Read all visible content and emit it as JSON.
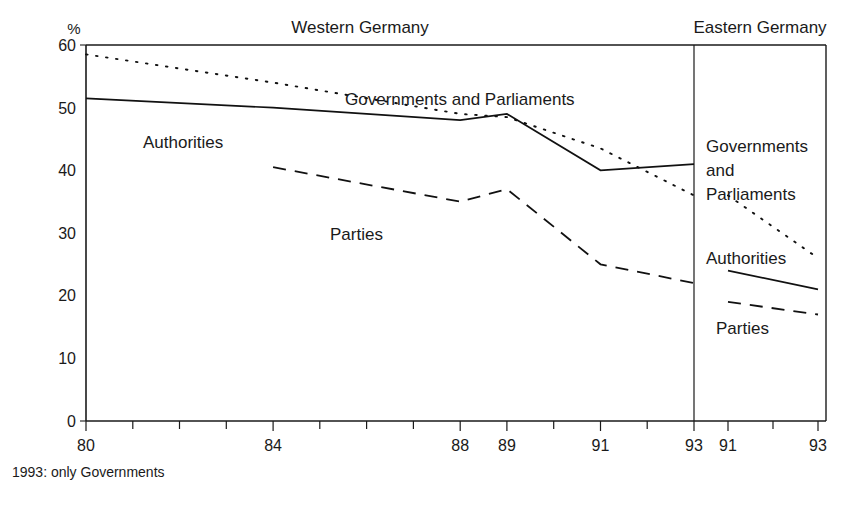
{
  "chart_data": {
    "type": "line",
    "title": "",
    "subtitle": "",
    "xlabel": "",
    "ylabel": "%",
    "ylim": [
      0,
      60
    ],
    "ytick_values": [
      0,
      10,
      20,
      30,
      40,
      50,
      60
    ],
    "ytick_labels": [
      "0",
      "10",
      "20",
      "30",
      "40",
      "50",
      "60"
    ],
    "grid": false,
    "legend_position": "inline-annotations",
    "panels": [
      {
        "name": "western",
        "title": "Western Germany",
        "x_range": [
          80,
          93
        ],
        "xtick_values": [
          80,
          81,
          82,
          83,
          84,
          85,
          86,
          87,
          88,
          89,
          90,
          91,
          92,
          93
        ],
        "xtick_labels": [
          "80",
          "",
          "",
          "",
          "84",
          "",
          "",
          "",
          "88",
          "89",
          "",
          "91",
          "",
          "93"
        ],
        "series": [
          {
            "name": "Governments and Parliaments",
            "style": "dotted",
            "x": [
              80,
              84,
              88,
              89,
              91,
              93
            ],
            "values": [
              58.5,
              54.0,
              49.0,
              48.5,
              43.5,
              36.0
            ]
          },
          {
            "name": "Authorities",
            "style": "solid",
            "x": [
              80,
              84,
              88,
              89,
              91,
              93
            ],
            "values": [
              51.5,
              50.0,
              48.0,
              49.0,
              40.0,
              41.0
            ]
          },
          {
            "name": "Parties",
            "style": "dashed",
            "x": [
              84,
              88,
              89,
              91,
              93
            ],
            "values": [
              40.5,
              35.0,
              37.0,
              25.0,
              22.0
            ]
          }
        ]
      },
      {
        "name": "eastern",
        "title": "Eastern Germany",
        "x_range": [
          91,
          93
        ],
        "xtick_values": [
          91,
          92,
          93
        ],
        "xtick_labels": [
          "91",
          "",
          "93"
        ],
        "series": [
          {
            "name": "Governments and Parliaments",
            "style": "dotted",
            "x": [
              91,
              93
            ],
            "values": [
              36.0,
              26.0
            ]
          },
          {
            "name": "Authorities",
            "style": "solid",
            "x": [
              91,
              93
            ],
            "values": [
              24.0,
              21.0
            ]
          },
          {
            "name": "Parties",
            "style": "dashed",
            "x": [
              91,
              93
            ],
            "values": [
              19.0,
              17.0
            ]
          }
        ]
      }
    ],
    "annotations": {
      "western_governments": "Governments and Parliaments",
      "western_authorities": "Authorities",
      "western_parties": "Parties",
      "eastern_governments_line1": "Governments",
      "eastern_governments_line2": "and",
      "eastern_governments_line3": "Parliaments",
      "eastern_authorities": "Authorities",
      "eastern_parties": "Parties"
    },
    "footnote": "1993: only Governments",
    "colors": {
      "ink": "#1a1a1a",
      "background": "#ffffff"
    }
  }
}
